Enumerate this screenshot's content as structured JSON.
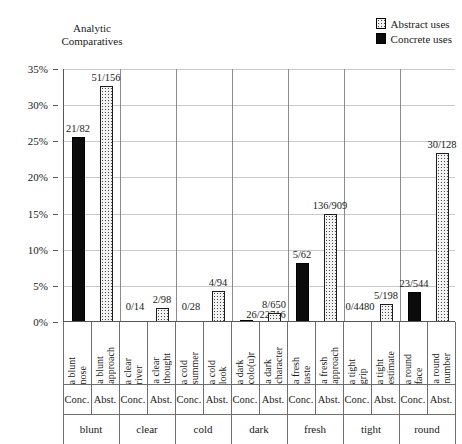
{
  "title": {
    "line1": "Analytic",
    "line2": "Comparatives"
  },
  "legend": {
    "position": "top-right",
    "items": [
      {
        "label": "Abstract uses",
        "swatch": "dotted-pattern-square-icon",
        "color": "#f2f2f2"
      },
      {
        "label": "Concrete uses",
        "swatch": "filled-black-square-icon",
        "color": "#0b0b0b"
      }
    ]
  },
  "axis": {
    "y_ticks": [
      "0%",
      "5%",
      "10%",
      "15%",
      "20%",
      "25%",
      "30%",
      "35%"
    ],
    "y_values": [
      0,
      5,
      10,
      15,
      20,
      25,
      30,
      35
    ]
  },
  "chart_data": {
    "type": "bar",
    "title": "Analytic Comparatives",
    "xlabel": "",
    "ylabel": "",
    "ylim": [
      0,
      35
    ],
    "ytick_labels": [
      "0%",
      "5%",
      "10%",
      "15%",
      "20%",
      "25%",
      "30%",
      "35%"
    ],
    "grid": true,
    "legend_position": "top-right",
    "legend_entries": [
      "Abstract uses",
      "Concrete uses"
    ],
    "groups": [
      "blunt",
      "clear",
      "cold",
      "dark",
      "fresh",
      "tight",
      "round"
    ],
    "subcolumns": [
      "Conc.",
      "Abst."
    ],
    "bars": [
      {
        "group": "blunt",
        "type": "Conc.",
        "phrase_line1": "a blunt",
        "phrase_line2": "nose",
        "label": "21/82",
        "numerator": 21,
        "denominator": 82,
        "value": 25.6
      },
      {
        "group": "blunt",
        "type": "Abst.",
        "phrase_line1": "a blunt",
        "phrase_line2": "approach",
        "label": "51/156",
        "numerator": 51,
        "denominator": 156,
        "value": 32.7
      },
      {
        "group": "clear",
        "type": "Conc.",
        "phrase_line1": "a clear",
        "phrase_line2": "river",
        "label": "0/14",
        "numerator": 0,
        "denominator": 14,
        "value": 0.0
      },
      {
        "group": "clear",
        "type": "Abst.",
        "phrase_line1": "a clear",
        "phrase_line2": "thought",
        "label": "2/98",
        "numerator": 2,
        "denominator": 98,
        "value": 2.0
      },
      {
        "group": "cold",
        "type": "Conc.",
        "phrase_line1": "a cold",
        "phrase_line2": "summer",
        "label": "0/28",
        "numerator": 0,
        "denominator": 28,
        "value": 0.0
      },
      {
        "group": "cold",
        "type": "Abst.",
        "phrase_line1": "a cold",
        "phrase_line2": "look",
        "label": "4/94",
        "numerator": 4,
        "denominator": 94,
        "value": 4.3
      },
      {
        "group": "dark",
        "type": "Conc.",
        "phrase_line1": "a dark",
        "phrase_line2": "colo(u)r",
        "label": "26/22716",
        "numerator": 26,
        "denominator": 22716,
        "value": 0.11
      },
      {
        "group": "dark",
        "type": "Abst.",
        "phrase_line1": "a dark",
        "phrase_line2": "character",
        "label": "8/650",
        "numerator": 8,
        "denominator": 650,
        "value": 1.2
      },
      {
        "group": "fresh",
        "type": "Conc.",
        "phrase_line1": "a fresh",
        "phrase_line2": "taste",
        "label": "5/62",
        "numerator": 5,
        "denominator": 62,
        "value": 8.1
      },
      {
        "group": "fresh",
        "type": "Abst.",
        "phrase_line1": "a fresh",
        "phrase_line2": "approach",
        "label": "136/909",
        "numerator": 136,
        "denominator": 909,
        "value": 15.0
      },
      {
        "group": "tight",
        "type": "Conc.",
        "phrase_line1": "a tight",
        "phrase_line2": "grip",
        "label": "0/4480",
        "numerator": 0,
        "denominator": 4480,
        "value": 0.0
      },
      {
        "group": "tight",
        "type": "Abst.",
        "phrase_line1": "a tight",
        "phrase_line2": "estimate",
        "label": "5/198",
        "numerator": 5,
        "denominator": 198,
        "value": 2.5
      },
      {
        "group": "round",
        "type": "Conc.",
        "phrase_line1": "a round",
        "phrase_line2": "face",
        "label": "23/544",
        "numerator": 23,
        "denominator": 544,
        "value": 4.2
      },
      {
        "group": "round",
        "type": "Abst.",
        "phrase_line1": "a round",
        "phrase_line2": "number",
        "label": "30/128",
        "numerator": 30,
        "denominator": 128,
        "value": 23.4
      }
    ]
  }
}
